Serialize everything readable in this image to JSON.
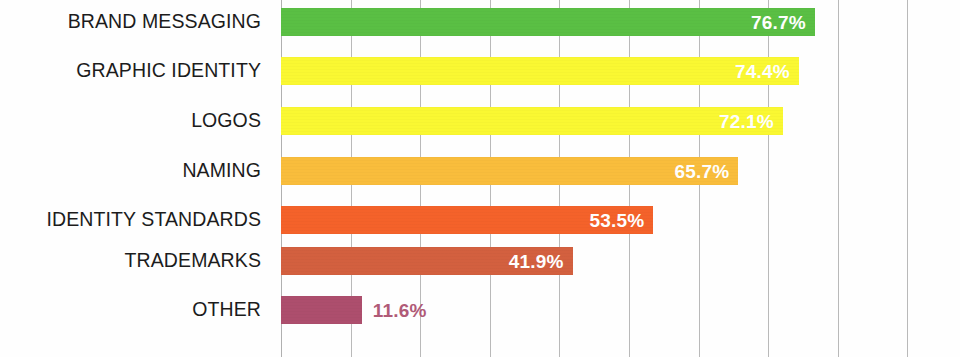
{
  "chart_data": {
    "type": "bar",
    "orientation": "horizontal",
    "title": "",
    "subtitle": "",
    "xlabel": "",
    "ylabel": "",
    "xlim": [
      0,
      90
    ],
    "ylim": null,
    "grid": true,
    "grid_axis": "x",
    "legend": false,
    "legend_position": "none",
    "value_format": "percent_one_decimal",
    "tick_labels_visible": false,
    "gridline_values": [
      0,
      10,
      20,
      30,
      40,
      50,
      60,
      70,
      80,
      90
    ],
    "categories": [
      "BRAND MESSAGING",
      "GRAPHIC IDENTITY",
      "LOGOS",
      "NAMING",
      "IDENTITY STANDARDS",
      "TRADEMARKS",
      "OTHER"
    ],
    "values": [
      76.7,
      74.4,
      72.1,
      65.7,
      53.5,
      41.9,
      11.6
    ],
    "value_labels": [
      "76.7%",
      "74.4%",
      "72.1%",
      "65.7%",
      "53.5%",
      "41.9%",
      "11.6%"
    ],
    "colors": [
      "#5abf44",
      "#faf832",
      "#faf832",
      "#f9bd3c",
      "#f4622a",
      "#d3603f",
      "#ad4e6d"
    ],
    "label_colors": [
      "#ffffff",
      "#ffffff",
      "#ffffff",
      "#ffffff",
      "#ffffff",
      "#ffffff",
      "#b05a77"
    ],
    "label_placement": [
      "inside",
      "inside",
      "inside",
      "inside",
      "inside",
      "inside",
      "outside"
    ]
  },
  "bars": [
    {
      "category": "BRAND MESSAGING",
      "value": 76.7,
      "label": "76.7%",
      "color": "#5abf44",
      "label_color": "#ffffff",
      "placement": "inside",
      "center_y": 22
    },
    {
      "category": "GRAPHIC IDENTITY",
      "value": 74.4,
      "label": "74.4%",
      "color": "#faf832",
      "label_color": "#ffffff",
      "placement": "inside",
      "center_y": 71
    },
    {
      "category": "LOGOS",
      "value": 72.1,
      "label": "72.1%",
      "color": "#faf832",
      "label_color": "#ffffff",
      "placement": "inside",
      "center_y": 121
    },
    {
      "category": "NAMING",
      "value": 65.7,
      "label": "65.7%",
      "color": "#f9bd3c",
      "label_color": "#ffffff",
      "placement": "inside",
      "center_y": 171
    },
    {
      "category": "IDENTITY STANDARDS",
      "value": 53.5,
      "label": "53.5%",
      "color": "#f4622a",
      "label_color": "#ffffff",
      "placement": "inside",
      "center_y": 220
    },
    {
      "category": "TRADEMARKS",
      "value": 41.9,
      "label": "41.9%",
      "color": "#d3603f",
      "label_color": "#ffffff",
      "placement": "inside",
      "center_y": 261
    },
    {
      "category": "OTHER",
      "value": 11.6,
      "label": "11.6%",
      "color": "#ad4e6d",
      "label_color": "#b05a77",
      "placement": "outside",
      "center_y": 310
    }
  ],
  "geometry": {
    "plot_left": 281,
    "plot_width": 679,
    "px_per_percent": 6.96,
    "bar_height": 28,
    "gridline_spacing": 69.6,
    "gridline_count": 10
  }
}
